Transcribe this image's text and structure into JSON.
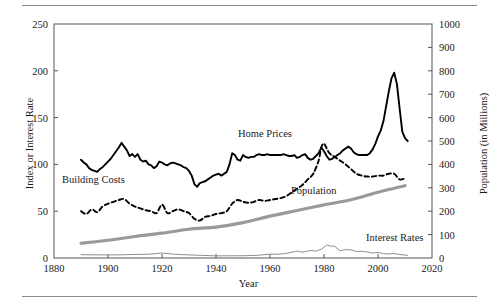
{
  "chart_data": {
    "type": "line",
    "title": "",
    "xlabel": "Year",
    "ylabel": "Index or Interest Rate",
    "ylabel_right": "Population (in Millions)",
    "xlim": [
      1880,
      2020
    ],
    "ylim": [
      0,
      250
    ],
    "ylim_right": [
      0,
      1000
    ],
    "xticks": [
      1880,
      1900,
      1920,
      1940,
      1960,
      1980,
      2000,
      2020
    ],
    "yticks": [
      0,
      50,
      100,
      150,
      200,
      250
    ],
    "yticks_right": [
      0,
      100,
      200,
      300,
      400,
      500,
      600,
      700,
      800,
      900,
      1000
    ],
    "grid": false,
    "legend_position": "inline-annotations",
    "series": [
      {
        "name": "Home Prices",
        "axis": "left",
        "style": "solid-thick-black",
        "color": "#000000",
        "label_x": 1948,
        "label_y": 143,
        "x": [
          1890,
          1891,
          1892,
          1893,
          1894,
          1895,
          1896,
          1897,
          1898,
          1899,
          1900,
          1901,
          1902,
          1903,
          1904,
          1905,
          1906,
          1907,
          1908,
          1909,
          1910,
          1911,
          1912,
          1913,
          1914,
          1915,
          1916,
          1917,
          1918,
          1919,
          1920,
          1921,
          1922,
          1923,
          1924,
          1925,
          1926,
          1927,
          1928,
          1929,
          1930,
          1931,
          1932,
          1933,
          1934,
          1935,
          1936,
          1937,
          1938,
          1939,
          1940,
          1941,
          1942,
          1943,
          1944,
          1945,
          1946,
          1947,
          1948,
          1949,
          1950,
          1951,
          1952,
          1953,
          1954,
          1955,
          1956,
          1957,
          1958,
          1959,
          1960,
          1961,
          1962,
          1963,
          1964,
          1965,
          1966,
          1967,
          1968,
          1969,
          1970,
          1971,
          1972,
          1973,
          1974,
          1975,
          1976,
          1977,
          1978,
          1979,
          1980,
          1981,
          1982,
          1983,
          1984,
          1985,
          1986,
          1987,
          1988,
          1989,
          1990,
          1991,
          1992,
          1993,
          1994,
          1995,
          1996,
          1997,
          1998,
          1999,
          2000,
          2001,
          2002,
          2003,
          2004,
          2005,
          2006,
          2007,
          2008,
          2009,
          2010,
          2011
        ],
        "y": [
          105,
          102,
          100,
          96,
          94,
          93,
          92,
          95,
          97,
          100,
          103,
          106,
          110,
          114,
          118,
          123,
          119,
          115,
          109,
          111,
          108,
          111,
          105,
          103,
          104,
          100,
          99,
          96,
          98,
          103,
          102,
          100,
          99,
          101,
          102,
          101,
          100,
          99,
          97,
          96,
          93,
          88,
          79,
          76,
          80,
          81,
          82,
          84,
          86,
          88,
          89,
          90,
          88,
          90,
          92,
          100,
          112,
          110,
          105,
          104,
          110,
          108,
          107,
          108,
          108,
          110,
          111,
          110,
          110,
          111,
          110,
          110,
          110,
          110,
          110,
          111,
          110,
          109,
          109,
          110,
          107,
          108,
          110,
          111,
          107,
          105,
          106,
          109,
          112,
          118,
          114,
          109,
          105,
          106,
          108,
          110,
          112,
          115,
          117,
          119,
          117,
          113,
          111,
          110,
          110,
          110,
          110,
          112,
          116,
          122,
          130,
          136,
          146,
          162,
          178,
          192,
          198,
          186,
          160,
          135,
          128,
          125
        ]
      },
      {
        "name": "Building Costs",
        "axis": "left",
        "style": "dashed-black",
        "color": "#000000",
        "label_x": 1897,
        "label_y": 72,
        "x": [
          1890,
          1892,
          1894,
          1896,
          1898,
          1900,
          1902,
          1904,
          1906,
          1908,
          1910,
          1912,
          1914,
          1916,
          1918,
          1920,
          1922,
          1924,
          1926,
          1928,
          1930,
          1932,
          1934,
          1936,
          1938,
          1940,
          1942,
          1944,
          1946,
          1948,
          1950,
          1952,
          1954,
          1956,
          1958,
          1960,
          1962,
          1964,
          1966,
          1968,
          1970,
          1972,
          1974,
          1976,
          1978,
          1979,
          1980,
          1982,
          1984,
          1986,
          1988,
          1990,
          1992,
          1994,
          1996,
          1998,
          2000,
          2002,
          2004,
          2006,
          2008,
          2010
        ],
        "y": [
          50,
          47,
          52,
          49,
          55,
          58,
          60,
          62,
          63,
          58,
          55,
          53,
          51,
          50,
          48,
          57,
          48,
          50,
          52,
          50,
          48,
          42,
          40,
          44,
          45,
          47,
          48,
          50,
          58,
          62,
          60,
          59,
          60,
          62,
          61,
          62,
          63,
          64,
          66,
          70,
          74,
          78,
          84,
          90,
          104,
          118,
          122,
          112,
          108,
          104,
          100,
          95,
          90,
          88,
          87,
          87,
          88,
          88,
          90,
          90,
          84,
          85
        ]
      },
      {
        "name": "Population",
        "axis": "right",
        "style": "solid-thick-gray",
        "color": "#9a9a9a",
        "label_x": 1965,
        "label_y": 250,
        "x": [
          1890,
          1900,
          1910,
          1920,
          1930,
          1940,
          1950,
          1960,
          1970,
          1980,
          1990,
          2000,
          2010
        ],
        "y": [
          63,
          76,
          92,
          106,
          123,
          132,
          151,
          179,
          203,
          227,
          249,
          281,
          309
        ]
      },
      {
        "name": "Interest Rates",
        "axis": "left",
        "style": "solid-thin-gray",
        "color": "#8f8f8f",
        "label_x": 1996,
        "label_y": 25,
        "x": [
          1890,
          1895,
          1900,
          1905,
          1910,
          1915,
          1920,
          1925,
          1930,
          1935,
          1940,
          1945,
          1950,
          1955,
          1960,
          1963,
          1966,
          1969,
          1970,
          1972,
          1975,
          1977,
          1979,
          1980,
          1981,
          1982,
          1984,
          1986,
          1988,
          1990,
          1992,
          1994,
          1996,
          1998,
          2000,
          2002,
          2004,
          2006,
          2008,
          2010,
          2011
        ],
        "y": [
          3.5,
          3.4,
          3.3,
          3.4,
          3.8,
          4.0,
          5.3,
          3.9,
          3.3,
          2.8,
          2.3,
          2.4,
          2.4,
          2.8,
          4.1,
          4.0,
          4.9,
          6.7,
          7.4,
          6.2,
          8.0,
          7.4,
          9.4,
          11.5,
          13.9,
          13.0,
          12.4,
          7.7,
          9.0,
          8.6,
          7.0,
          7.1,
          6.4,
          5.3,
          6.0,
          4.6,
          4.3,
          4.8,
          3.7,
          3.2,
          2.8
        ]
      }
    ]
  },
  "axes": {
    "left_title": "Index or Interest Rate",
    "right_title": "Population (in Millions)",
    "x_title": "Year"
  },
  "annotations": {
    "home_prices": "Home Prices",
    "building_costs": "Building Costs",
    "population": "Population",
    "interest_rates": "Interest Rates"
  },
  "colors": {
    "home_prices": "#000000",
    "building_costs": "#000000",
    "population": "#9a9a9a",
    "interest_rates": "#8f8f8f",
    "axis": "#555555",
    "rule": "#8a8a8a"
  }
}
